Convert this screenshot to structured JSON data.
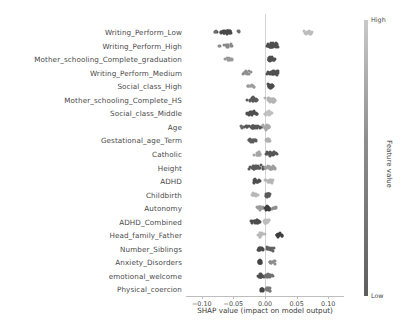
{
  "chart_data": {
    "type": "scatter",
    "plot_kind": "shap-beeswarm-summary",
    "title": "",
    "xlabel": "SHAP value (impact on model output)",
    "ylabel": "",
    "xlim": [
      -0.125,
      0.125
    ],
    "xticks": [
      -0.1,
      -0.05,
      0.0,
      0.05,
      0.1
    ],
    "xticklabels": [
      "−0.10",
      "−0.05",
      "0.00",
      "0.05",
      "0.10"
    ],
    "grid": false,
    "zero_line": 0.0,
    "colorbar": {
      "title": "Feature value",
      "high_label": "High",
      "low_label": "Low",
      "low_color": "#5e5e5e",
      "mid_color": "#8d8d8d",
      "high_color": "#c9c9c9",
      "position": "right"
    },
    "categories": [
      "Writing_Perform_Low",
      "Writing_Perform_High",
      "Mother_schooling_Complete_graduation",
      "Writing_Perform_Medium",
      "Social_class_High",
      "Mother_schooling_Complete_HS",
      "Social_class_Middle",
      "Age",
      "Gestational_age_Term",
      "Catholic",
      "Height",
      "ADHD",
      "Childbirth",
      "Autonomy",
      "ADHD_Combined",
      "Head_family_Father",
      "Number_Siblings",
      "Anxiety_Disorders",
      "emotional_welcome",
      "Physical_coercion"
    ],
    "series": [
      {
        "name": "Writing_Perform_Low",
        "clusters": [
          {
            "center": -0.063,
            "spread": 0.013,
            "n": 34,
            "color": "#4a4a4a"
          },
          {
            "center": -0.08,
            "spread": 0.003,
            "n": 3,
            "color": "#6e6e6e"
          },
          {
            "center": -0.043,
            "spread": 0.003,
            "n": 3,
            "color": "#6e6e6e"
          },
          {
            "center": 0.07,
            "spread": 0.009,
            "n": 18,
            "color": "#bcbcbc"
          }
        ]
      },
      {
        "name": "Writing_Perform_High",
        "clusters": [
          {
            "center": -0.06,
            "spread": 0.018,
            "n": 14,
            "color": "#8a8a8a"
          },
          {
            "center": 0.012,
            "spread": 0.008,
            "n": 42,
            "color": "#4f4f4f"
          }
        ]
      },
      {
        "name": "Mother_schooling_Complete_graduation",
        "clusters": [
          {
            "center": -0.058,
            "spread": 0.01,
            "n": 10,
            "color": "#9a9a9a"
          },
          {
            "center": 0.01,
            "spread": 0.005,
            "n": 34,
            "color": "#4f4f4f"
          }
        ]
      },
      {
        "name": "Writing_Perform_Medium",
        "clusters": [
          {
            "center": -0.03,
            "spread": 0.007,
            "n": 14,
            "color": "#8f8f8f"
          },
          {
            "center": 0.013,
            "spread": 0.009,
            "n": 40,
            "color": "#505050"
          }
        ]
      },
      {
        "name": "Social_class_High",
        "clusters": [
          {
            "center": -0.022,
            "spread": 0.006,
            "n": 10,
            "color": "#9c9c9c"
          },
          {
            "center": 0.008,
            "spread": 0.004,
            "n": 28,
            "color": "#4d4d4d"
          }
        ]
      },
      {
        "name": "Mother_schooling_Complete_HS",
        "clusters": [
          {
            "center": -0.018,
            "spread": 0.009,
            "n": 26,
            "color": "#5a5a5a"
          },
          {
            "center": 0.01,
            "spread": 0.008,
            "n": 24,
            "color": "#b4b4b4"
          }
        ]
      },
      {
        "name": "Social_class_Middle",
        "clusters": [
          {
            "center": -0.02,
            "spread": 0.008,
            "n": 22,
            "color": "#4f4f4f"
          },
          {
            "center": 0.006,
            "spread": 0.005,
            "n": 18,
            "color": "#c0c0c0"
          }
        ]
      },
      {
        "name": "Age",
        "clusters": [
          {
            "center": -0.019,
            "spread": 0.012,
            "n": 30,
            "color": "#565656"
          },
          {
            "center": 0.004,
            "spread": 0.007,
            "n": 26,
            "color": "#a8a8a8"
          },
          {
            "center": -0.037,
            "spread": 0.003,
            "n": 4,
            "color": "#6b6b6b"
          }
        ]
      },
      {
        "name": "Gestational_age_Term",
        "clusters": [
          {
            "center": -0.021,
            "spread": 0.007,
            "n": 16,
            "color": "#5c5c5c"
          },
          {
            "center": 0.004,
            "spread": 0.004,
            "n": 14,
            "color": "#b0b0b0"
          }
        ]
      },
      {
        "name": "Catholic",
        "clusters": [
          {
            "center": -0.011,
            "spread": 0.005,
            "n": 14,
            "color": "#a5a5a5"
          },
          {
            "center": 0.01,
            "spread": 0.008,
            "n": 26,
            "color": "#565656"
          }
        ]
      },
      {
        "name": "Height",
        "clusters": [
          {
            "center": -0.014,
            "spread": 0.011,
            "n": 30,
            "color": "#5a5a5a"
          },
          {
            "center": 0.008,
            "spread": 0.009,
            "n": 26,
            "color": "#9e9e9e"
          }
        ]
      },
      {
        "name": "ADHD",
        "clusters": [
          {
            "center": -0.012,
            "spread": 0.008,
            "n": 18,
            "color": "#4e4e4e"
          },
          {
            "center": 0.007,
            "spread": 0.006,
            "n": 18,
            "color": "#b6b6b6"
          }
        ]
      },
      {
        "name": "Childbirth",
        "clusters": [
          {
            "center": -0.016,
            "spread": 0.006,
            "n": 12,
            "color": "#b8b8b8"
          },
          {
            "center": 0.004,
            "spread": 0.004,
            "n": 22,
            "color": "#5a5a5a"
          }
        ]
      },
      {
        "name": "Autonomy",
        "clusters": [
          {
            "center": -0.007,
            "spread": 0.005,
            "n": 16,
            "color": "#9a9a9a"
          },
          {
            "center": 0.004,
            "spread": 0.004,
            "n": 24,
            "color": "#3f3f3f"
          },
          {
            "center": 0.015,
            "spread": 0.004,
            "n": 8,
            "color": "#8e8e8e"
          }
        ]
      },
      {
        "name": "ADHD_Combined",
        "clusters": [
          {
            "center": -0.013,
            "spread": 0.009,
            "n": 24,
            "color": "#4d4d4d"
          },
          {
            "center": 0.003,
            "spread": 0.006,
            "n": 18,
            "color": "#bcbcbc"
          }
        ]
      },
      {
        "name": "Head_family_Father",
        "clusters": [
          {
            "center": -0.006,
            "spread": 0.005,
            "n": 12,
            "color": "#b9b9b9"
          },
          {
            "center": 0.022,
            "spread": 0.007,
            "n": 14,
            "color": "#3d3d3d"
          }
        ]
      },
      {
        "name": "Number_Siblings",
        "clusters": [
          {
            "center": -0.007,
            "spread": 0.005,
            "n": 20,
            "color": "#4a4a4a"
          },
          {
            "center": 0.008,
            "spread": 0.007,
            "n": 16,
            "color": "#616161"
          }
        ]
      },
      {
        "name": "Anxiety_Disorders",
        "clusters": [
          {
            "center": -0.008,
            "spread": 0.004,
            "n": 16,
            "color": "#454545"
          },
          {
            "center": 0.01,
            "spread": 0.006,
            "n": 12,
            "color": "#8c8c8c"
          }
        ]
      },
      {
        "name": "emotional_welcome",
        "clusters": [
          {
            "center": -0.006,
            "spread": 0.004,
            "n": 16,
            "color": "#4f4f4f"
          },
          {
            "center": 0.006,
            "spread": 0.006,
            "n": 18,
            "color": "#6f6f6f"
          }
        ]
      },
      {
        "name": "Physical_coercion",
        "clusters": [
          {
            "center": -0.005,
            "spread": 0.003,
            "n": 14,
            "color": "#454545"
          },
          {
            "center": 0.006,
            "spread": 0.005,
            "n": 12,
            "color": "#7a7a7a"
          }
        ]
      }
    ]
  }
}
